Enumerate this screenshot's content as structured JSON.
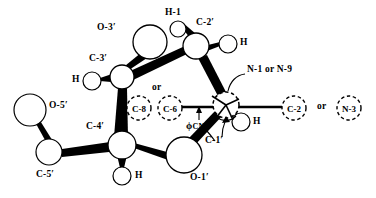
{
  "figure": {
    "type": "chemical-structure-diagram",
    "background": "#ffffff",
    "stroke_color": "#000000",
    "width": 376,
    "height": 198
  },
  "labels": {
    "o3prime": "O-3′",
    "c3prime": "C-3′",
    "h_c3prime": "H",
    "h1": "H-1",
    "c2prime": "C-2′",
    "h_c2prime": "H",
    "or_top": "or",
    "c8": "C-8",
    "c6": "C-6",
    "phi_main": "ϕ",
    "phi_sub": "CN",
    "n1_or_n9": "N-1 or N-9",
    "c2": "C-2",
    "or_right": "or",
    "n3": "N-3",
    "h_c1prime": "H",
    "c1prime": "C-1′",
    "o5prime": "O-5′",
    "c5prime": "C-5′",
    "c4prime": "C-4′",
    "h_c4prime": "H",
    "o1prime": "O-1′"
  },
  "atoms": [
    {
      "name": "O-3′",
      "cx": 150,
      "cy": 42,
      "r": 17,
      "style": "solid"
    },
    {
      "name": "C-3′",
      "cx": 122,
      "cy": 77,
      "r": 12,
      "style": "solid"
    },
    {
      "name": "H·C-3′",
      "cx": 92,
      "cy": 81,
      "r": 9,
      "style": "solid"
    },
    {
      "name": "H-1",
      "cx": 178,
      "cy": 29,
      "r": 8,
      "style": "solid"
    },
    {
      "name": "C-2′",
      "cx": 196,
      "cy": 46,
      "r": 13,
      "style": "solid"
    },
    {
      "name": "H·C-2′",
      "cx": 228,
      "cy": 44,
      "r": 9,
      "style": "solid"
    },
    {
      "name": "C-8",
      "cx": 139,
      "cy": 108,
      "r": 12,
      "style": "dashed"
    },
    {
      "name": "C-6",
      "cx": 170,
      "cy": 108,
      "r": 12,
      "style": "dashed"
    },
    {
      "name": "C-1′",
      "cx": 226,
      "cy": 105,
      "r": 13,
      "style": "dashed"
    },
    {
      "name": "H·C-1′",
      "cx": 241,
      "cy": 122,
      "r": 9,
      "style": "solid"
    },
    {
      "name": "C-2",
      "cx": 294,
      "cy": 108,
      "r": 12,
      "style": "dashed"
    },
    {
      "name": "N-3",
      "cx": 349,
      "cy": 108,
      "r": 12,
      "style": "dashed"
    },
    {
      "name": "O-5′",
      "cx": 30,
      "cy": 110,
      "r": 16,
      "style": "solid"
    },
    {
      "name": "C-5′",
      "cx": 49,
      "cy": 152,
      "r": 13,
      "style": "solid"
    },
    {
      "name": "C-4′",
      "cx": 122,
      "cy": 145,
      "r": 14,
      "style": "solid"
    },
    {
      "name": "H·C-4′",
      "cx": 122,
      "cy": 176,
      "r": 9,
      "style": "solid"
    },
    {
      "name": "O-1′",
      "cx": 184,
      "cy": 155,
      "r": 18,
      "style": "solid"
    }
  ],
  "bonds": [
    {
      "from": "C-3′",
      "to": "O-3′",
      "kind": "wedge"
    },
    {
      "from": "C-3′",
      "to": "H·C-3′",
      "kind": "wedge"
    },
    {
      "from": "C-3′",
      "to": "C-2′",
      "kind": "wedge"
    },
    {
      "from": "C-3′",
      "to": "C-4′",
      "kind": "wedge"
    },
    {
      "from": "C-2′",
      "to": "H-1",
      "kind": "wedge"
    },
    {
      "from": "C-2′",
      "to": "H·C-2′",
      "kind": "wedge"
    },
    {
      "from": "C-2′",
      "to": "C-1′",
      "kind": "wedge"
    },
    {
      "from": "C-1′",
      "to": "C-6",
      "kind": "line"
    },
    {
      "from": "C-1′",
      "to": "C-2",
      "kind": "line"
    },
    {
      "from": "C-1′",
      "to": "H·C-1′",
      "kind": "wedge"
    },
    {
      "from": "C-1′",
      "to": "O-1′",
      "kind": "wedge"
    },
    {
      "from": "O-1′",
      "to": "C-4′",
      "kind": "wedge"
    },
    {
      "from": "C-4′",
      "to": "H·C-4′",
      "kind": "wedge"
    },
    {
      "from": "C-4′",
      "to": "C-5′",
      "kind": "wedge"
    },
    {
      "from": "C-5′",
      "to": "O-5′",
      "kind": "wedge"
    }
  ],
  "annotations": {
    "torsion_arrow": "ϕCN torsion pointer at C-6 — C-1′ bond",
    "newman_marks": "radiating spokes at C-1′ indicating rotation axis",
    "leader_n1n9": "curved leader from N-1 or N-9 label to C-1′ circle",
    "leader_c1prime": "curved leader from C-1′ label to C-1′ circle"
  }
}
